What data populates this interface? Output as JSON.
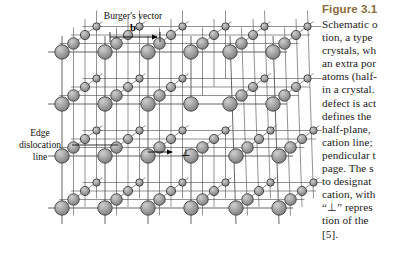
{
  "figure": {
    "title": "Figure 3.1",
    "caption_lines": [
      "Schematic o",
      "tion, a type",
      "crystals, wh",
      "an extra por",
      "atoms (half-",
      "in a crystal.",
      "defect is act",
      "defines the",
      "half-plane,",
      "cation line;",
      "pendicular t",
      "page. The s",
      "to designat",
      "cation, with",
      "“⊥” repres",
      "tion of the",
      "[5]."
    ],
    "title_color": "#8a6d3b",
    "text_color": "#1b1b1b"
  },
  "diagram": {
    "type": "edge-dislocation-crystal-lattice",
    "background": "#ffffff",
    "atom_fill": "#9d9d9d",
    "atom_stroke": "#2e2e2e",
    "bond_color": "#4a4a4a",
    "labels": {
      "burgers_vector": "Burger's vector",
      "burgers_symbol": "b",
      "edge_dislocation_line": [
        "Edge",
        "dislocation",
        "line"
      ],
      "dislocation_symbol": "⊥"
    },
    "lattice": {
      "columns": 6,
      "rows": 4,
      "depth_atoms": 4,
      "half_plane_column_index": 3,
      "half_plane_rows": 2
    }
  }
}
